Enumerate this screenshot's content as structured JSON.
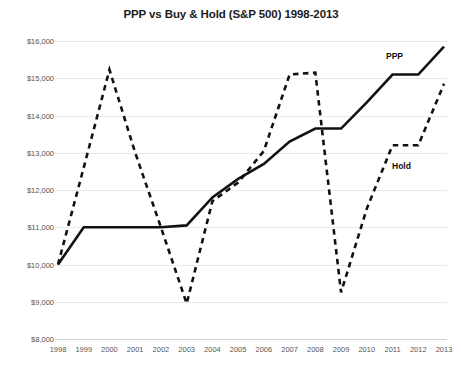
{
  "chart_data": {
    "type": "line",
    "title": "PPP vs Buy & Hold (S&P 500) 1998-2013",
    "xlabel": "",
    "ylabel": "",
    "x": [
      1998,
      1999,
      2000,
      2001,
      2002,
      2003,
      2004,
      2005,
      2006,
      2007,
      2008,
      2009,
      2010,
      2011,
      2012,
      2013
    ],
    "categories": [
      "1998",
      "1999",
      "2000",
      "2001",
      "2002",
      "2003",
      "2004",
      "2005",
      "2006",
      "2007",
      "2008",
      "2009",
      "2010",
      "2011",
      "2012",
      "2013"
    ],
    "series": [
      {
        "name": "PPP",
        "style": "solid",
        "color": "#111111",
        "values": [
          10000,
          11000,
          11000,
          11000,
          11000,
          11050,
          11800,
          12300,
          12700,
          13300,
          13650,
          13650,
          14350,
          15100,
          15100,
          15850
        ]
      },
      {
        "name": "Hold",
        "style": "dashed",
        "color": "#111111",
        "values": [
          10000,
          12600,
          15230,
          13000,
          11000,
          8950,
          11700,
          12200,
          13050,
          15100,
          15150,
          9250,
          11500,
          13200,
          13200,
          14850
        ]
      }
    ],
    "ylim": [
      8000,
      16000
    ],
    "ytick_values": [
      8000,
      9000,
      10000,
      11000,
      12000,
      13000,
      14000,
      15000,
      16000
    ],
    "ytick_labels": [
      "$8,000",
      "$9,000",
      "$10,000",
      "$11,000",
      "$12,000",
      "$13,000",
      "$14,000",
      "$15,000",
      "$16,000"
    ],
    "xlim": [
      1998,
      2013
    ],
    "grid": "horizontal",
    "legend_position": "inline-annotations",
    "annotations": [
      {
        "text": "PPP",
        "series": "PPP"
      },
      {
        "text": "Hold",
        "series": "Hold"
      }
    ],
    "background_color": "#ffffff",
    "gridline_color": "#e9e9e9"
  }
}
